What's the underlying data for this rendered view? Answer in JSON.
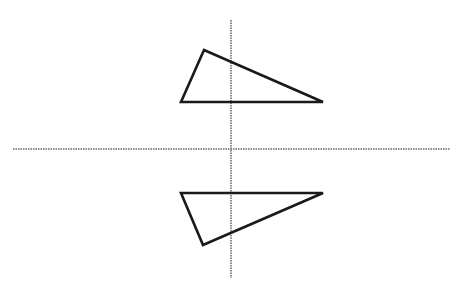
{
  "diagram": {
    "background": "#ffffff",
    "axes": {
      "color": "#8a8a8a",
      "horizontal": {
        "x1": 13,
        "y1": 149,
        "x2": 450,
        "y2": 149
      },
      "vertical": {
        "x1": 231,
        "y1": 20,
        "x2": 231,
        "y2": 278
      }
    },
    "shapes": [
      {
        "name": "original-triangle",
        "stroke": "#1a1a1a",
        "points": [
          [
            204,
            50
          ],
          [
            181,
            102
          ],
          [
            323,
            102
          ]
        ]
      },
      {
        "name": "reflected-triangle",
        "stroke": "#1a1a1a",
        "points": [
          [
            181,
            193
          ],
          [
            323,
            193
          ],
          [
            203,
            245
          ]
        ]
      }
    ]
  }
}
